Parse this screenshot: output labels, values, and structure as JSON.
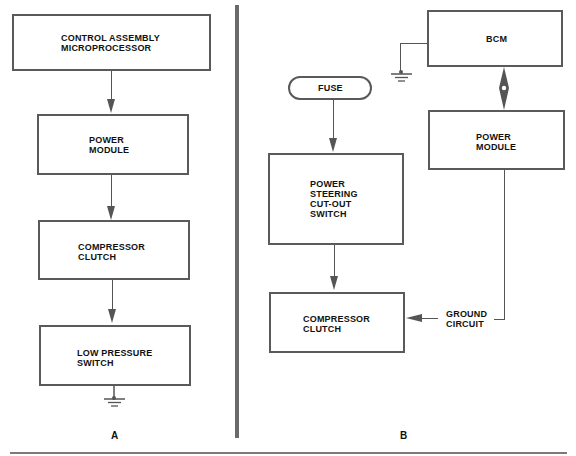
{
  "panel_a": {
    "caption": "A",
    "boxes": [
      {
        "label": "CONTROL ASSEMBLY\nMICROPROCESSOR"
      },
      {
        "label": "POWER\nMODULE"
      },
      {
        "label": "COMPRESSOR\nCLUTCH"
      },
      {
        "label": "LOW PRESSURE\nSWITCH"
      }
    ],
    "ground_icon": "ground-symbol"
  },
  "panel_b": {
    "caption": "B",
    "fuse": {
      "label": "FUSE"
    },
    "bcm": {
      "label": "BCM"
    },
    "power_module": {
      "label": "POWER\nMODULE"
    },
    "ps_switch": {
      "label": "POWER\nSTEERING\nCUT-OUT\nSWITCH"
    },
    "compressor_clutch": {
      "label": "COMPRESSOR\nCLUTCH"
    },
    "ground_circuit": {
      "label": "GROUND\nCIRCUIT"
    },
    "ground_icon": "ground-symbol",
    "bidirectional_arrow_icon": "double-arrow"
  },
  "colors": {
    "line": "#555555",
    "divider": "#6a6a6a",
    "text": "#111111",
    "background": "#ffffff"
  }
}
